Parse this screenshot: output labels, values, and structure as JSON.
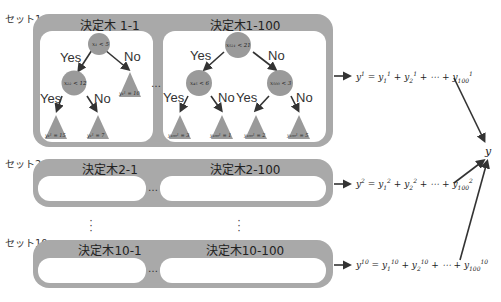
{
  "sets": [
    {
      "label": "セット1",
      "trees": [
        {
          "title": "決定木 1-1"
        },
        {
          "title": "決定木1-100"
        }
      ],
      "ellipsis": "…",
      "formula": {
        "lhs": "y",
        "lhs_sup": "1",
        "terms": [
          "y₁¹",
          "y₂¹",
          "⋯",
          "y₁₀₀¹"
        ],
        "text": "y¹ = y₁¹ + y₂¹ + ⋯ + y₁₀₀¹"
      }
    },
    {
      "label": "セット2",
      "trees": [
        {
          "title": "決定木2-1"
        },
        {
          "title": "決定木2-100"
        }
      ],
      "ellipsis": "…",
      "formula": {
        "text": "y² = y₁² + y₂² + ⋯ + y₁₀₀²"
      }
    },
    {
      "label": "セット10",
      "trees": [
        {
          "title": "決定木10-1"
        },
        {
          "title": "決定木10-100"
        }
      ],
      "ellipsis": "…",
      "formula": {
        "text": "y¹⁰ = y₁¹⁰ + y₂¹⁰ + ⋯ + y₁₀₀¹⁰"
      }
    }
  ],
  "vertical_ellipsis": "⋮",
  "output_label": "y",
  "tree_1_1": {
    "root": "x₁ < 5",
    "left": "x₂₂ < 12",
    "right_leaf": "y₁¹ = 10",
    "leaves": [
      "y₁¹ = 15",
      "y₁¹ = 7"
    ],
    "edge_labels": {
      "yes": "Yes",
      "no": "No"
    }
  },
  "tree_1_100": {
    "root": "x₅₂₁ < 21",
    "left": "x₄₅ < 6",
    "right": "x₅₀₀ < 3",
    "leaves": [
      "y₁₀₀¹ = 3",
      "y₁₀₀¹ = 1",
      "y₁₀₀¹ = 2",
      "y₁₀₀¹ = 5"
    ],
    "edge_labels": {
      "yes": "Yes",
      "no": "No"
    }
  },
  "colors": {
    "box_gray": "#a9a9a9",
    "node_gray": "#9a9a9a",
    "arrow": "#333333",
    "background": "#ffffff"
  }
}
